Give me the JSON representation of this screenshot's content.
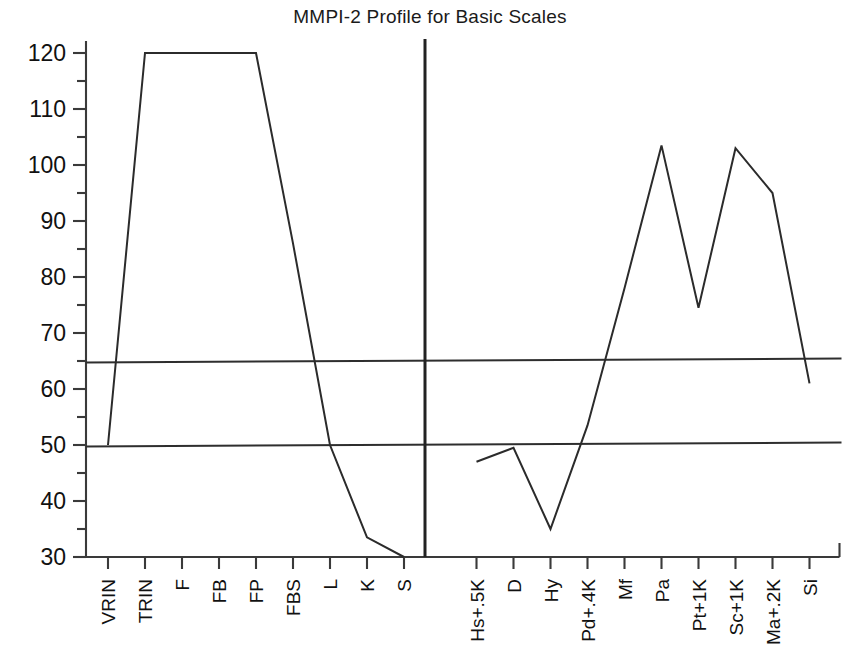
{
  "chart_data": {
    "type": "line",
    "title": "MMPI-2 Profile for Basic Scales",
    "xlabel": "",
    "ylabel": "",
    "ylim": [
      30,
      123
    ],
    "yticks": [
      30,
      40,
      50,
      60,
      70,
      80,
      90,
      100,
      110,
      120
    ],
    "ytick_labels": [
      "30",
      "40",
      "50",
      "60",
      "70",
      "80",
      "90",
      "100",
      "110",
      "120"
    ],
    "yminor_ticks": [
      35,
      45,
      55,
      65,
      75,
      85,
      95,
      105,
      115
    ],
    "grid": false,
    "legend": "none",
    "reference_lines": [
      {
        "value": 65,
        "label": "T = 65 clinical cutoff"
      },
      {
        "value": 50,
        "label": "T = 50 mean"
      }
    ],
    "panel_divider": {
      "after_category": "S",
      "label": "validity-clinical divider"
    },
    "panels": [
      {
        "name": "Validity Scales",
        "categories": [
          "VRIN",
          "TRIN",
          "F",
          "FB",
          "FP",
          "FBS",
          "L",
          "K",
          "S"
        ],
        "values": [
          50,
          120,
          120,
          120,
          120,
          86,
          50,
          33.5,
          30
        ]
      },
      {
        "name": "Clinical Scales",
        "categories": [
          "Hs+.5K",
          "D",
          "Hy",
          "Pd+.4K",
          "Mf",
          "Pa",
          "Pt+1K",
          "Sc+1K",
          "Ma+.2K",
          "Si"
        ],
        "values": [
          47,
          49.5,
          35,
          53.5,
          78,
          103.5,
          74.5,
          103,
          95,
          61
        ]
      }
    ],
    "categories": [
      "VRIN",
      "TRIN",
      "F",
      "FB",
      "FP",
      "FBS",
      "L",
      "K",
      "S",
      "Hs+.5K",
      "D",
      "Hy",
      "Pd+.4K",
      "Mf",
      "Pa",
      "Pt+1K",
      "Sc+1K",
      "Ma+.2K",
      "Si"
    ],
    "series": [
      {
        "name": "T-score profile",
        "values": [
          50,
          120,
          120,
          120,
          120,
          86,
          50,
          33.5,
          30,
          47,
          49.5,
          35,
          53.5,
          78,
          103.5,
          74.5,
          103,
          95,
          61
        ]
      }
    ],
    "colors": {
      "line": "#2b2b2b",
      "axis": "#3a3a3a",
      "reference": "#2e2e2e",
      "background": "#ffffff",
      "text": "#111111"
    }
  }
}
